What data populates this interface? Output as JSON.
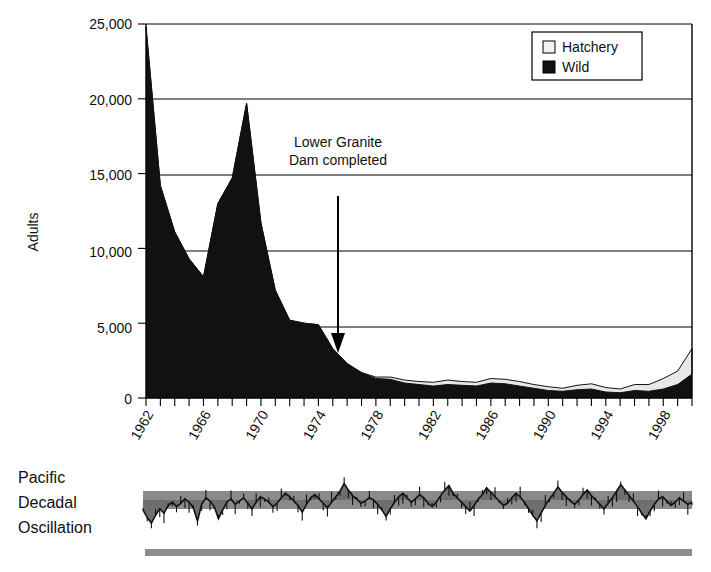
{
  "figure": {
    "title": "",
    "axis_y_label": "Adults",
    "annotation": {
      "line1": "Lower Granite",
      "line2": "Dam completed"
    },
    "pdo_label": {
      "line1": "Pacific",
      "line2": "Decadal",
      "line3": "Oscillation"
    }
  },
  "legend": {
    "entries": [
      {
        "label": "Hatchery",
        "color": "#f2f2f2",
        "swatch": "hatchery-swatch"
      },
      {
        "label": "Wild",
        "color": "#111111",
        "swatch": "wild-swatch"
      }
    ]
  },
  "chart_data": {
    "type": "area",
    "title": "",
    "subtitle": "",
    "xlabel": "",
    "ylabel": "Adults",
    "stacked": true,
    "grid": true,
    "legend_position": "top-right",
    "xlim": [
      1962,
      2000
    ],
    "ylim": [
      0,
      25000
    ],
    "ytick_labels": [
      "0",
      "5,000",
      "10,000",
      "15,000",
      "20,000",
      "25,000"
    ],
    "yticks": [
      0,
      5000,
      10000,
      15000,
      20000,
      25000
    ],
    "xtick_labels": [
      "1962",
      "1966",
      "1970",
      "1974",
      "1978",
      "1982",
      "1986",
      "1990",
      "1994",
      "1998"
    ],
    "xticks": [
      1962,
      1966,
      1970,
      1974,
      1978,
      1982,
      1986,
      1990,
      1994,
      1998
    ],
    "x": [
      1962,
      1963,
      1964,
      1965,
      1966,
      1967,
      1968,
      1969,
      1970,
      1971,
      1972,
      1973,
      1974,
      1975,
      1976,
      1977,
      1978,
      1979,
      1980,
      1981,
      1982,
      1983,
      1984,
      1985,
      1986,
      1987,
      1988,
      1989,
      1990,
      1991,
      1992,
      1993,
      1994,
      1995,
      1996,
      1997,
      1998,
      1999,
      2000
    ],
    "series": [
      {
        "name": "Wild",
        "color": "#111111",
        "values": [
          24800,
          14200,
          11100,
          9300,
          8100,
          13000,
          14700,
          19700,
          11700,
          7200,
          5200,
          5000,
          4900,
          3300,
          2300,
          1700,
          1300,
          1250,
          1000,
          900,
          800,
          900,
          850,
          800,
          1000,
          950,
          800,
          650,
          500,
          450,
          550,
          600,
          400,
          350,
          500,
          450,
          600,
          900,
          1600
        ]
      },
      {
        "name": "Hatchery",
        "color": "#e8e8e8",
        "values": [
          0,
          0,
          0,
          0,
          0,
          0,
          0,
          0,
          0,
          0,
          0,
          0,
          0,
          0,
          0,
          0,
          100,
          150,
          200,
          200,
          250,
          300,
          250,
          250,
          300,
          300,
          300,
          250,
          250,
          200,
          300,
          350,
          300,
          250,
          400,
          450,
          700,
          900,
          1700
        ]
      }
    ],
    "annotations": [
      {
        "text": "Lower Granite Dam completed",
        "x": 1975,
        "arrow_from_y": 15000,
        "arrow_to_y": 3500
      }
    ]
  },
  "pdo_panel": {
    "type": "line",
    "label": "Pacific Decadal Oscillation",
    "band_color": "#8a8a8a",
    "trace_color": "#111111",
    "values": [
      -0.9,
      -1.6,
      -2.1,
      -1.4,
      -0.8,
      -1.2,
      -0.5,
      -0.2,
      -0.6,
      -0.3,
      0.1,
      -0.2,
      -0.7,
      -1.9,
      -0.4,
      0.2,
      -0.1,
      -0.6,
      -1.7,
      -0.9,
      -0.2,
      0.1,
      -0.4,
      -0.1,
      0.2,
      -0.3,
      -0.8,
      -0.2,
      0.3,
      0.1,
      -0.2,
      -0.6,
      -0.3,
      0.2,
      0.6,
      0.3,
      -0.1,
      -0.5,
      -1.1,
      -0.4,
      0.2,
      0.5,
      0.1,
      -0.3,
      -0.7,
      -0.2,
      0.3,
      0.8,
      1.5,
      0.9,
      0.4,
      0.1,
      -0.3,
      -0.1,
      0.2,
      0.0,
      -0.4,
      -0.9,
      -1.5,
      -0.8,
      -0.2,
      0.3,
      0.6,
      0.2,
      -0.2,
      0.1,
      0.5,
      0.2,
      -0.3,
      -0.6,
      -0.2,
      0.4,
      0.9,
      1.3,
      0.6,
      0.2,
      -0.2,
      -0.6,
      -1.0,
      -0.5,
      0.1,
      0.5,
      1.1,
      0.7,
      0.3,
      -0.1,
      -0.5,
      -0.3,
      0.2,
      0.6,
      0.3,
      -0.2,
      -0.8,
      -1.4,
      -1.9,
      -1.2,
      -0.5,
      0.1,
      0.6,
      1.2,
      0.7,
      0.3,
      -0.1,
      -0.4,
      0.0,
      0.5,
      0.9,
      0.4,
      0.0,
      -0.4,
      -0.8,
      -0.3,
      0.2,
      0.8,
      1.4,
      0.9,
      0.4,
      -0.1,
      -0.6,
      -1.2,
      -1.7,
      -1.0,
      -0.4,
      0.1,
      0.3,
      -0.1,
      -0.5,
      -0.2,
      0.2,
      -0.1,
      -0.4,
      -0.2
    ]
  }
}
